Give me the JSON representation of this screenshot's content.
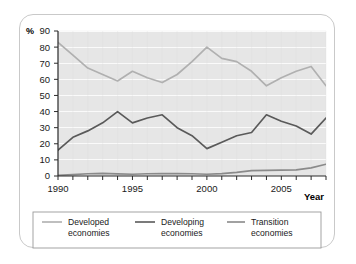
{
  "figure": {
    "unit_label": "%",
    "x_axis_name": "Year"
  },
  "legend": {
    "items": [
      {
        "label_line1": "Developed",
        "label_line2": "economies",
        "color": "#b0b0b0"
      },
      {
        "label_line1": "Developing",
        "label_line2": "economies",
        "color": "#5a5a5a"
      },
      {
        "label_line1": "Transition",
        "label_line2": "economies",
        "color": "#8a8a8a"
      }
    ]
  },
  "chart_data": {
    "type": "line",
    "title": "",
    "xlabel": "Year",
    "ylabel": "%",
    "xlim": [
      1990,
      2008
    ],
    "ylim": [
      0,
      90
    ],
    "ytick_step": 10,
    "yticks": [
      0,
      10,
      20,
      30,
      40,
      50,
      60,
      70,
      80,
      90
    ],
    "ytick_labels": [
      "0",
      "10",
      "20",
      "30",
      "40",
      "50",
      "60",
      "70",
      "80",
      "90"
    ],
    "x": [
      1990,
      1991,
      1992,
      1993,
      1994,
      1995,
      1996,
      1997,
      1998,
      1999,
      2000,
      2001,
      2002,
      2003,
      2004,
      2005,
      2006,
      2007,
      2008
    ],
    "xticks": [
      1990,
      1995,
      2000,
      2005
    ],
    "xtick_labels": [
      "1990",
      "1995",
      "2000",
      "2005"
    ],
    "grid": "horizontal-white",
    "legend_position": "below",
    "series": [
      {
        "name": "Developed economies",
        "color": "#b0b0b0",
        "values": [
          83,
          75,
          67,
          63,
          59,
          65,
          61,
          58,
          63,
          71,
          80,
          73,
          71,
          65,
          56,
          61,
          65,
          68,
          56
        ]
      },
      {
        "name": "Developing economies",
        "color": "#5a5a5a",
        "values": [
          16,
          24,
          28,
          33,
          40,
          33,
          36,
          38,
          30,
          25,
          17,
          21,
          25,
          27,
          38,
          34,
          31,
          26,
          36
        ]
      },
      {
        "name": "Transition economies",
        "color": "#8a8a8a",
        "values": [
          0.4,
          0.8,
          1.4,
          1.6,
          1.3,
          1.1,
          1.4,
          1.5,
          1.5,
          1.4,
          1.1,
          1.5,
          2.2,
          3.3,
          3.5,
          3.6,
          3.8,
          5.0,
          7.3
        ]
      }
    ]
  }
}
